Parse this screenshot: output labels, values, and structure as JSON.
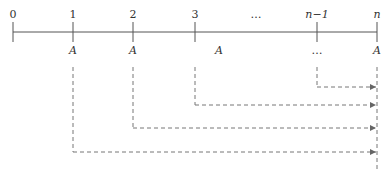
{
  "diagram": {
    "type": "annuity-timeline",
    "colors": {
      "axis": "#555555",
      "dash": "#777777",
      "text": "#333333"
    },
    "period_labels": [
      {
        "text": "0",
        "x": 13
      },
      {
        "text": "1",
        "x": 73
      },
      {
        "text": "2",
        "x": 133
      },
      {
        "text": "3",
        "x": 195
      },
      {
        "text": "…",
        "x": 256
      },
      {
        "text": "n−1",
        "x": 317
      },
      {
        "text": "n",
        "x": 377
      }
    ],
    "payment_labels": [
      {
        "text": "A",
        "x": 73
      },
      {
        "text": "A",
        "x": 133
      },
      {
        "text": "A",
        "x": 219
      },
      {
        "text": "…",
        "x": 317
      },
      {
        "text": "A",
        "x": 377
      }
    ],
    "flows": [
      {
        "from_period": "n−1",
        "from_x": 317,
        "y": 87
      },
      {
        "from_period": "3",
        "from_x": 195,
        "y": 105
      },
      {
        "from_period": "2",
        "from_x": 133,
        "y": 128
      },
      {
        "from_period": "1",
        "from_x": 73,
        "y": 152
      }
    ],
    "target_x": 377
  }
}
